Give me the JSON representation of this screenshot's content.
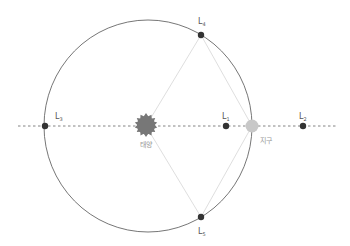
{
  "diagram": {
    "colors": {
      "orbit": "#666666",
      "axis_dashed": "#666666",
      "guide_lines": "#cccccc",
      "sun": "#777777",
      "earth": "#c8c8c8",
      "lagrange_point": "#333333",
      "label": "#555555",
      "body_label": "#999999"
    },
    "bodies": {
      "sun": {
        "label": "태양"
      },
      "earth": {
        "label": "지구"
      }
    },
    "points": [
      {
        "id": "L1",
        "base": "L",
        "sub": "1"
      },
      {
        "id": "L2",
        "base": "L",
        "sub": "2"
      },
      {
        "id": "L3",
        "base": "L",
        "sub": "3"
      },
      {
        "id": "L4",
        "base": "L",
        "sub": "4"
      },
      {
        "id": "L5",
        "base": "L",
        "sub": "5"
      }
    ]
  }
}
